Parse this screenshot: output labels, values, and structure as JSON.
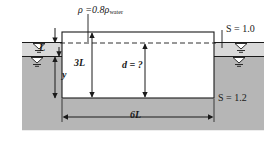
{
  "figure": {
    "background": "#ffffff"
  },
  "colors": {
    "upper_fluid_fill": "#d9d9d9",
    "lower_fluid_fill": "#b6b6b6",
    "line": "#1a1a1a",
    "block_fill": "#ffffff"
  },
  "labels": {
    "density": {
      "rho": "ρ",
      "equals": " =0.8",
      "rho_water": "ρ",
      "water_sub": "water"
    },
    "depth_L": "L",
    "depth_y": "y",
    "height_3L": "3L",
    "draft": "d = ?",
    "width_6L": "6L",
    "s_upper": "S  =  1.0",
    "s_lower": "S  =  1.2"
  },
  "symbols": {
    "free_surface_upper": "free-surface-triangle",
    "free_surface_interface": "free-surface-triangle",
    "leader_line": "leader-line",
    "dashed_waterline": "dashed-waterline"
  },
  "geometry": {
    "block": {
      "x": 62,
      "y": 32,
      "width": 152,
      "height": 66
    },
    "upper_fluid_band": {
      "top": 42,
      "bottom": 56
    },
    "lower_fluid_top": 56,
    "ground_bottom": 130,
    "dashed_line_y": 43
  }
}
